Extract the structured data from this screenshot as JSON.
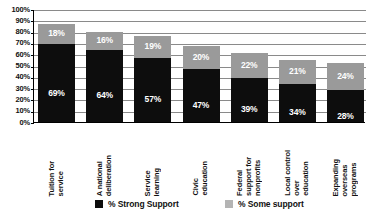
{
  "chart_data": {
    "type": "bar",
    "stacked": true,
    "title": "",
    "xlabel": "",
    "ylabel": "",
    "ylim": [
      0,
      100
    ],
    "grid": true,
    "legend_position": "bottom",
    "categories": [
      "Tuition for\nservice",
      "A national\ndeliberation",
      "Service\nlearning",
      "Civic\neducation",
      "Federal\nsupport for\nnonprofits",
      "Local control\nover\neducation",
      "Expanding\noverseas\nprograms"
    ],
    "ticks": [
      "0%",
      "10%",
      "20%",
      "30%",
      "40%",
      "50%",
      "60%",
      "70%",
      "80%",
      "90%",
      "100%"
    ],
    "series": [
      {
        "name": "% Strong Support",
        "color": "#0d0d0d",
        "values": [
          69,
          64,
          57,
          47,
          39,
          34,
          28
        ],
        "labels": [
          "69%",
          "64%",
          "57%",
          "47%",
          "39%",
          "34%",
          "28%"
        ]
      },
      {
        "name": "% Some support",
        "color": "#9a9a9a",
        "values": [
          18,
          16,
          19,
          20,
          22,
          21,
          24
        ],
        "labels": [
          "18%",
          "16%",
          "19%",
          "20%",
          "22%",
          "21%",
          "24%"
        ]
      }
    ]
  },
  "legend": {
    "items": [
      {
        "label": "% Strong Support",
        "swatch": "strong"
      },
      {
        "label": "% Some support",
        "swatch": "some"
      }
    ]
  }
}
